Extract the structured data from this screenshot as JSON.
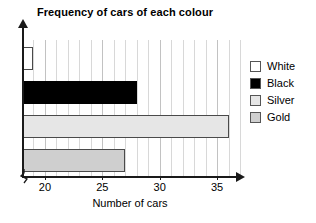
{
  "chart_data": {
    "type": "bar",
    "orientation": "horizontal",
    "title": "Frequency of cars of each colour",
    "xlabel": "Number of cars",
    "ylabel": "",
    "categories": [
      "White",
      "Black",
      "Silver",
      "Gold"
    ],
    "values": [
      19,
      28,
      36,
      27
    ],
    "xlim": [
      18,
      37
    ],
    "xticks": [
      20,
      25,
      30,
      35
    ],
    "xtick_labels": [
      "20",
      "25",
      "30",
      "35"
    ],
    "grid": true,
    "grid_axis": "x",
    "legend_position": "right",
    "axis_break": true,
    "series": [
      {
        "name": "White",
        "value": 19,
        "color": "#ffffff",
        "border": "#4a4a4a"
      },
      {
        "name": "Black",
        "value": 28,
        "color": "#000000",
        "border": "#000000"
      },
      {
        "name": "Silver",
        "value": 36,
        "color": "#e6e6e6",
        "border": "#4a4a4a"
      },
      {
        "name": "Gold",
        "value": 27,
        "color": "#cfcfcf",
        "border": "#4a4a4a"
      }
    ]
  },
  "legend": {
    "items": [
      {
        "label": "White",
        "swatch": "#ffffff"
      },
      {
        "label": "Black",
        "swatch": "#000000"
      },
      {
        "label": "Silver",
        "swatch": "#e6e6e6"
      },
      {
        "label": "Gold",
        "swatch": "#cfcfcf"
      }
    ]
  },
  "colors": {
    "axis": "#1a1a1a",
    "grid": "#d8d8d8",
    "grid_major": "#c2c2c2",
    "text": "#000000",
    "background": "#ffffff"
  }
}
